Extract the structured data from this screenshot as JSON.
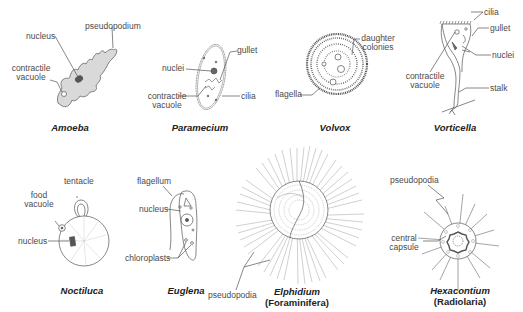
{
  "organisms": [
    {
      "id": "amoeba",
      "name": "Amoeba",
      "labels": {
        "nucleus": "nucleus",
        "pseudopodium": "pseudopodium",
        "contractile_vacuole_1": "contractile",
        "contractile_vacuole_2": "vacuole"
      }
    },
    {
      "id": "paramecium",
      "name": "Paramecium",
      "labels": {
        "gullet": "gullet",
        "nuclei": "nuclei",
        "contractile_vacuole_1": "contractile",
        "contractile_vacuole_2": "vacuole",
        "cilia": "cilia"
      }
    },
    {
      "id": "volvox",
      "name": "Volvox",
      "labels": {
        "daughter_colonies_1": "daughter",
        "daughter_colonies_2": "colonies",
        "flagella": "flagella"
      }
    },
    {
      "id": "vorticella",
      "name": "Vorticella",
      "labels": {
        "cilia": "cilia",
        "gullet": "gullet",
        "nuclei": "nuclei",
        "contractile_vacuole_1": "contractile",
        "contractile_vacuole_2": "vacuole",
        "stalk": "stalk"
      }
    },
    {
      "id": "noctiluca",
      "name": "Noctiluca",
      "labels": {
        "tentacle": "tentacle",
        "food_vacuole_1": "food",
        "food_vacuole_2": "vacuole",
        "nucleus": "nucleus"
      }
    },
    {
      "id": "euglena",
      "name": "Euglena",
      "labels": {
        "flagellum": "flagellum",
        "nucleus": "nucleus",
        "chloroplasts": "chloroplasts"
      }
    },
    {
      "id": "elphidium",
      "name": "Elphidium",
      "group": "(Foraminifera)",
      "labels": {
        "pseudopodia": "pseudopodia"
      }
    },
    {
      "id": "hexacontium",
      "name": "Hexacontium",
      "group": "(Radiolaria)",
      "labels": {
        "pseudopodia": "pseudopodia",
        "central_capsule_1": "central",
        "central_capsule_2": "capsule"
      }
    }
  ],
  "colors": {
    "line": "#555555",
    "amoeba_fill": "#d9d9d9",
    "background": "#ffffff"
  }
}
